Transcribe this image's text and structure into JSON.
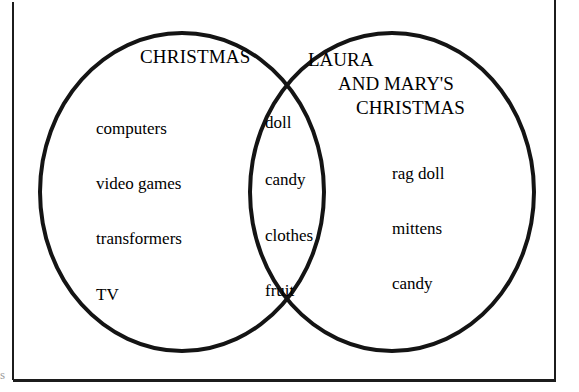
{
  "diagram": {
    "type": "venn",
    "sets": [
      {
        "id": "christmas",
        "title": "CHRISTMAS",
        "title_lines": [
          "CHRISTMAS"
        ],
        "exclusive_items": [
          "computers",
          "video games",
          "transformers",
          "TV"
        ]
      },
      {
        "id": "laura-and-marys-christmas",
        "title": "LAURA AND MARY'S CHRISTMAS",
        "title_lines": [
          "LAURA",
          "AND MARY'S",
          "CHRISTMAS"
        ],
        "exclusive_items": [
          "rag doll",
          "mittens",
          "candy"
        ]
      }
    ],
    "intersection_items": [
      "doll",
      "candy",
      "clothes",
      "fruit"
    ],
    "colors": {
      "stroke": "#141414",
      "text": "#000000",
      "background": "#ffffff",
      "frame": "#1c1c1c",
      "artifact": "#9a9a9a"
    },
    "artifact_glyph": "s"
  }
}
